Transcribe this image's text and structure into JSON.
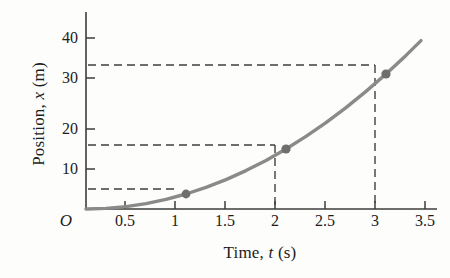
{
  "chart_data": {
    "type": "line",
    "title": "",
    "xlabel_parts": {
      "pre": "Time, ",
      "sym": "t",
      "post": " (s)"
    },
    "ylabel_parts": {
      "pre": "Position, ",
      "sym": "x",
      "post": " (m)"
    },
    "xlabel": "Time, t (s)",
    "ylabel": "Position, x (m)",
    "origin_label": "O",
    "xlim": [
      0,
      3.6
    ],
    "ylim": [
      0,
      45
    ],
    "grid": false,
    "legend": null,
    "xticks": [
      0.5,
      1,
      1.5,
      2,
      2.5,
      3,
      3.5
    ],
    "xtick_labels": [
      "0.5",
      "1",
      "1.5",
      "2",
      "2.5",
      "3",
      "3.5"
    ],
    "yticks": [
      10,
      20,
      30,
      40
    ],
    "ytick_labels": [
      "10",
      "20",
      "30",
      "40"
    ],
    "curve": {
      "name": "position",
      "equation": "x = 0.5*a*t^2, a = 7.5 m/s^2",
      "t_start": 0,
      "t_end": 3.35,
      "x": [
        0,
        0.2,
        0.4,
        0.6,
        0.8,
        1.0,
        1.2,
        1.4,
        1.6,
        1.8,
        2.0,
        2.2,
        2.4,
        2.6,
        2.8,
        3.0,
        3.2,
        3.35
      ],
      "y": [
        0,
        0.15,
        0.6,
        1.35,
        2.4,
        3.75,
        5.4,
        7.35,
        9.6,
        12.15,
        15.0,
        18.15,
        21.6,
        25.35,
        29.4,
        33.75,
        38.4,
        42.1
      ]
    },
    "points": [
      {
        "label": "p1",
        "t": 1,
        "x": 3.75
      },
      {
        "label": "p2",
        "t": 2,
        "x": 15.0
      },
      {
        "label": "p3",
        "t": 3,
        "x": 33.75
      }
    ],
    "guide_lines": [
      {
        "from_t": 0,
        "to_t": 1,
        "y": 3.75,
        "style": "dashed"
      },
      {
        "from_t": 0,
        "to_t": 2,
        "y": 15.0,
        "style": "dashed"
      },
      {
        "from_t": 0,
        "to_t": 3,
        "y": 33.75,
        "style": "dashed"
      },
      {
        "t": 2,
        "from_y": 0,
        "to_y": 15.0,
        "style": "dashed"
      },
      {
        "t": 3,
        "from_y": 0,
        "to_y": 33.75,
        "style": "dashed"
      }
    ],
    "colors": {
      "curve": "#8a8a8a",
      "marker": "#6e6e6e",
      "axis": "#3c3c3c",
      "dashed": "#3f3f3f",
      "text": "#1c1c1c",
      "background": "#fdfdfb"
    }
  }
}
